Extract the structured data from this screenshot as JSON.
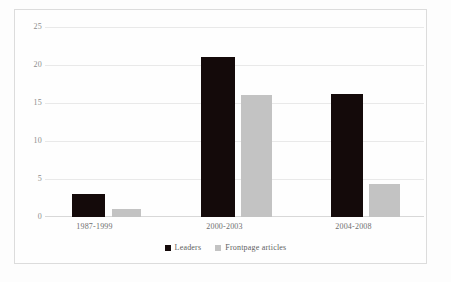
{
  "chart_data": {
    "type": "bar",
    "title": "",
    "subtitle": "",
    "xlabel": "",
    "ylabel": "",
    "categories": [
      "1987-1999",
      "2000-2003",
      "2004-2008"
    ],
    "series": [
      {
        "name": "Leaders",
        "color": "#140a0a",
        "values": [
          3.0,
          21.1,
          16.2
        ]
      },
      {
        "name": "Frontpage articles",
        "color": "#c3c3c3",
        "values": [
          1.0,
          16.1,
          4.3
        ]
      }
    ],
    "ylim": [
      0,
      25
    ],
    "yticks": [
      0,
      5,
      10,
      15,
      20,
      25
    ],
    "ytick_labels": [
      "0",
      "5",
      "10",
      "15",
      "20",
      "25"
    ],
    "grid": true,
    "grid_axis": "y",
    "legend_position": "bottom-center",
    "bar_group_order": [
      "Leaders",
      "Frontpage articles"
    ]
  },
  "legend": {
    "entries": [
      {
        "label": "Leaders",
        "swatch": "legend-swatch-leaders"
      },
      {
        "label": "Frontpage articles",
        "swatch": "legend-swatch-frontpage"
      }
    ]
  },
  "axis": {
    "y_labels": [
      "25",
      "20",
      "15",
      "10",
      "5",
      "0"
    ],
    "x_labels": [
      "1987-1999",
      "2000-2003",
      "2004-2008"
    ]
  },
  "colors": {
    "leaders": "#140a0a",
    "frontpage": "#c3c3c3",
    "gridline": "#e9e9e9",
    "axis_text": "#8d8d8d",
    "frame": "#dcdcdc",
    "background": "#fefefe"
  }
}
